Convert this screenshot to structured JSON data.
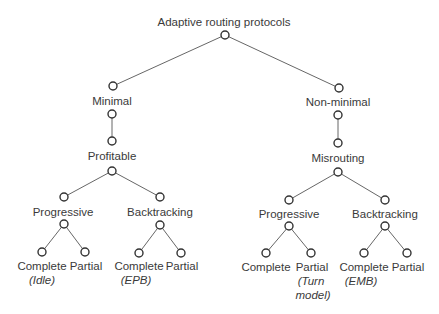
{
  "diagram": {
    "type": "tree",
    "root": {
      "label": "Adaptive routing protocols"
    },
    "branches": {
      "minimal": {
        "label": "Minimal",
        "child": {
          "label": "Profitable",
          "progressive": {
            "label": "Progressive",
            "complete": {
              "label": "Complete",
              "note": "(Idle)"
            },
            "partial": {
              "label": "Partial"
            }
          },
          "backtracking": {
            "label": "Backtracking",
            "complete": {
              "label": "Complete",
              "note": "(EPB)"
            },
            "partial": {
              "label": "Partial"
            }
          }
        }
      },
      "nonminimal": {
        "label": "Non-minimal",
        "child": {
          "label": "Misrouting",
          "progressive": {
            "label": "Progressive",
            "complete": {
              "label": "Complete"
            },
            "partial": {
              "label": "Partial",
              "note_line1": "(Turn",
              "note_line2": "model)"
            }
          },
          "backtracking": {
            "label": "Backtracking",
            "complete": {
              "label": "Complete",
              "note": "(EMB)"
            },
            "partial": {
              "label": "Partial"
            }
          }
        }
      }
    }
  }
}
